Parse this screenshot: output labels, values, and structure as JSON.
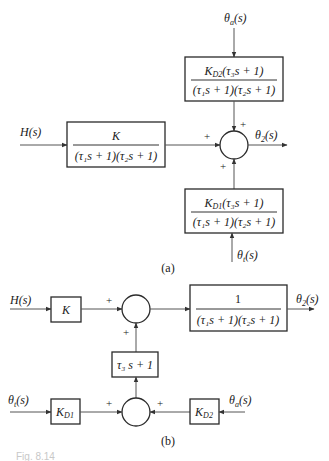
{
  "diagram_a": {
    "caption": "(a)",
    "inputs": {
      "h": "H(s)",
      "theta_a": "θ",
      "theta_a_sub": "a",
      "theta_a_arg": "(s)",
      "theta_t": "θ",
      "theta_t_sub": "t",
      "theta_t_arg": "(s)"
    },
    "output": {
      "theta": "θ",
      "sub": "2",
      "arg": "(s)"
    },
    "blocks": {
      "plant": {
        "numerator": "K",
        "denominator": "(τ₁s + 1)(τ₂s + 1)"
      },
      "disturbance_top": {
        "numerator": "K_D2(τ₃s + 1)",
        "num_k": "K",
        "num_sub": "D2",
        "num_rest": "(τ₃s + 1)",
        "denominator": "(τ₁s + 1)(τ₂s + 1)"
      },
      "disturbance_bottom": {
        "numerator": "K_D1(τ₃s + 1)",
        "num_k": "K",
        "num_sub": "D1",
        "num_rest": "(τ₃s + 1)",
        "denominator": "(τ₁s + 1)(τ₂s + 1)"
      }
    },
    "summing_junction": {
      "signs": [
        "+",
        "+",
        "+"
      ]
    }
  },
  "diagram_b": {
    "caption": "(b)",
    "inputs": {
      "h": "H(s)",
      "theta_t": "θ",
      "theta_t_sub": "t",
      "theta_t_arg": "(s)",
      "theta_a": "θ",
      "theta_a_sub": "a",
      "theta_a_arg": "(s)"
    },
    "output": {
      "theta": "θ",
      "sub": "2",
      "arg": "(s)"
    },
    "blocks": {
      "gain": {
        "label": "K"
      },
      "plant": {
        "numerator": "1",
        "denominator": "(τ₁s + 1)(τ₂s + 1)"
      },
      "lead": {
        "label": "τ₃ s + 1"
      },
      "kd1": {
        "k": "K",
        "sub": "D1"
      },
      "kd2": {
        "k": "K",
        "sub": "D2"
      }
    },
    "summing_junction_main": {
      "signs": [
        "+",
        "+"
      ]
    },
    "summing_junction_dist": {
      "signs": [
        "+",
        "+"
      ]
    }
  },
  "figure_caption": "Fig. 8.14"
}
